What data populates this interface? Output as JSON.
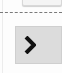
{
  "top_button": {
    "label": ""
  },
  "divider": {
    "style": "dashed"
  },
  "next_button": {
    "icon": "chevron-right-icon",
    "glyph": "›",
    "background": "#dcdcdc",
    "icon_color": "#111111"
  }
}
